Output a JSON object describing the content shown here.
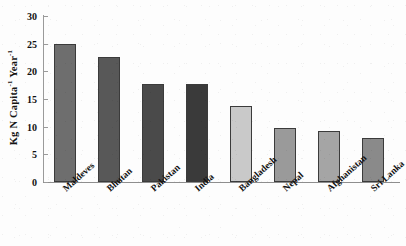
{
  "chart_data": {
    "type": "bar",
    "title": "",
    "xlabel": "",
    "ylabel": "Kg N Capita-1 Year-1",
    "ylabel_parts": {
      "base1": "Kg N Capita",
      "sup1": "-1",
      "base2": " Year",
      "sup2": "-1"
    },
    "categories": [
      "Maldeves",
      "Bhutan",
      "Pakistan",
      "India",
      "Bangladesh",
      "Nepal",
      "Afghanistan",
      "Sri Lanka"
    ],
    "values": [
      25.0,
      22.6,
      17.8,
      17.8,
      13.8,
      9.8,
      9.2,
      8.0
    ],
    "bar_colors": [
      "#6e6e6e",
      "#585858",
      "#4a4a4a",
      "#3a3a3a",
      "#c9c9c9",
      "#9a9a9a",
      "#a5a5a5",
      "#8a8a8a"
    ],
    "ylim": [
      0,
      30
    ],
    "ytick_values": [
      0,
      5,
      10,
      15,
      20,
      25,
      30
    ],
    "ytick_labels": [
      "0",
      "5",
      "10",
      "15",
      "20",
      "25",
      "30"
    ],
    "grid": false,
    "legend": "none",
    "axis_color": "#9a9a9a",
    "bar_edge_color": "#3b3b3b",
    "background": "#fdfdfd"
  }
}
